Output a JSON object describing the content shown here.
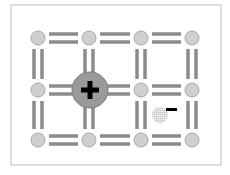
{
  "diagram": {
    "frame": {
      "x": 11,
      "y": 5,
      "width": 210,
      "height": 160,
      "stroke": "#bdbdbd"
    },
    "colors": {
      "atom_fill": "#cfcfcf",
      "atom_stroke": "#a8a8a8",
      "bond": "#8c8c8c",
      "ion_fill": "#9a9a9a",
      "ion_stroke": "#7a7a7a",
      "sign": "#000000",
      "electron_fill": "#d9d9d9"
    },
    "grid": {
      "columns_x": [
        38,
        89,
        141,
        192
      ],
      "rows_y": [
        38,
        90,
        140
      ],
      "atom_radius": 7
    },
    "ion": {
      "label": "+",
      "x": 90,
      "y": 90,
      "radius": 18,
      "description": "positively charged ion / hole"
    },
    "electron": {
      "label": "−",
      "x": 160,
      "y": 115,
      "radius": 8,
      "description": "free electron"
    }
  }
}
